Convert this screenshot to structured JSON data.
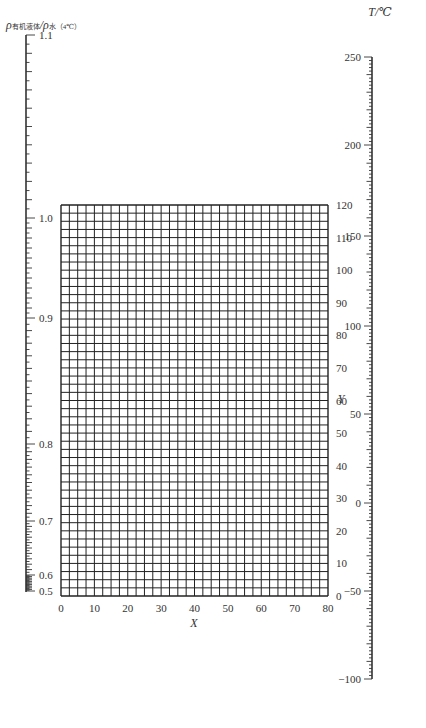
{
  "chart_data": {
    "type": "nomogram",
    "title": "",
    "left_scale": {
      "label_main": "ρ",
      "label_sub1": "有机液体",
      "label_sep": "/ρ",
      "label_sub2": "水（4℃）",
      "ticks": [
        "1.1",
        "1.0",
        "0.9",
        "0.8",
        "0.7",
        "0.6",
        "0.5"
      ],
      "values": [
        1.1,
        1.0,
        0.9,
        0.8,
        0.7,
        0.6,
        0.5
      ],
      "y_px": [
        35,
        218,
        318,
        444,
        521,
        575,
        591
      ],
      "range": [
        0.5,
        1.1
      ]
    },
    "grid": {
      "xlabel": "X",
      "ylabel": "Y",
      "x_ticks": [
        "0",
        "10",
        "20",
        "30",
        "40",
        "50",
        "60",
        "70",
        "80"
      ],
      "y_ticks": [
        "0",
        "10",
        "20",
        "30",
        "40",
        "50",
        "60",
        "70",
        "80",
        "90",
        "100",
        "110",
        "120"
      ],
      "xlim": [
        0,
        80
      ],
      "ylim": [
        0,
        120
      ],
      "x_minor_step": 2.5,
      "y_minor_step": 2.5,
      "grid": true
    },
    "right_scale": {
      "label": "T/℃",
      "ticks": [
        "250",
        "200",
        "150",
        "100",
        "50",
        "0",
        "−50",
        "−100"
      ],
      "values": [
        250,
        200,
        150,
        100,
        50,
        0,
        -50,
        -100
      ],
      "y_px": [
        57,
        145,
        236,
        326,
        414,
        503,
        591,
        679
      ],
      "range": [
        -100,
        250
      ]
    }
  }
}
